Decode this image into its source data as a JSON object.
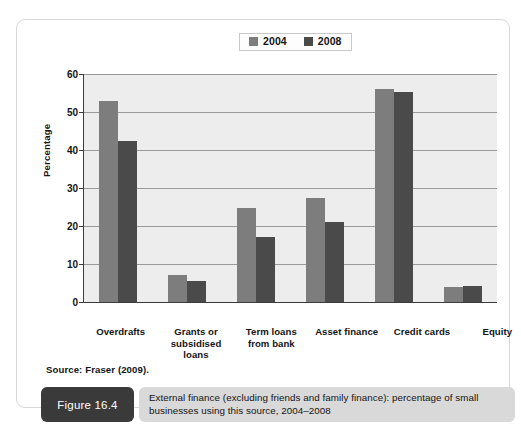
{
  "legend": {
    "entries": [
      {
        "label": "2004",
        "color": "#7d7d7d"
      },
      {
        "label": "2008",
        "color": "#4a4a4a"
      }
    ]
  },
  "source_note": "Source: Fraser (2009).",
  "caption": {
    "tag": "Figure 16.4",
    "text": "External finance (excluding friends and family finance): percentage of small businesses using this source, 2004–2008"
  },
  "chart_data": {
    "type": "bar",
    "title": "",
    "xlabel": "",
    "ylabel": "Percentage",
    "ylim": [
      0,
      60
    ],
    "yticks": [
      0,
      10,
      20,
      30,
      40,
      50,
      60
    ],
    "grid": true,
    "legend_position": "top-center",
    "categories": [
      "Overdrafts",
      "Grants or\nsubsidised\nloans",
      "Term loans\nfrom bank",
      "Asset finance",
      "Credit cards",
      "Equity"
    ],
    "series": [
      {
        "name": "2004",
        "color": "#7d7d7d",
        "values": [
          53,
          7,
          24.8,
          27.5,
          56,
          4
        ]
      },
      {
        "name": "2008",
        "color": "#4a4a4a",
        "values": [
          42.3,
          5.5,
          17,
          21,
          55.3,
          4.3
        ]
      }
    ]
  }
}
